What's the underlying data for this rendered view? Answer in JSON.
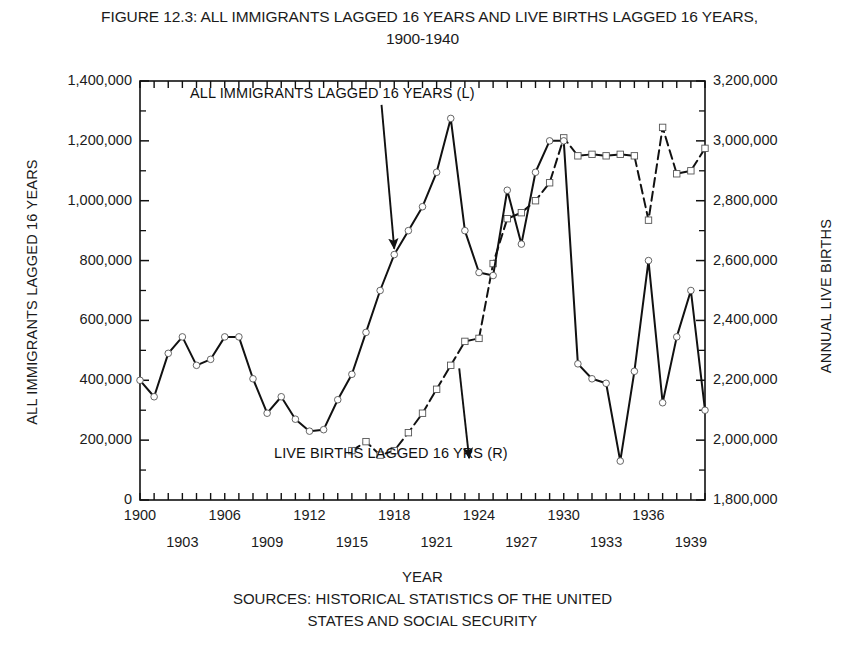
{
  "figure": {
    "title_line1": "FIGURE 12.3: ALL IMMIGRANTS LAGGED 16 YEARS AND LIVE BIRTHS LAGGED 16 YEARS,",
    "title_line2": "1900-1940",
    "footer_line1": "YEAR",
    "footer_line2": "SOURCES: HISTORICAL STATISTICS OF THE UNITED",
    "footer_line3": "STATES AND SOCIAL SECURITY"
  },
  "chart_data": {
    "type": "line",
    "title": "FIGURE 12.3: ALL IMMIGRANTS LAGGED 16 YEARS AND LIVE BIRTHS LAGGED 16 YEARS, 1900-1940",
    "xlabel": "YEAR",
    "ylabel": "ALL IMMIGRANTS LAGGED 16 YEARS",
    "ylabel_right": "ANNUAL LIVE BIRTHS",
    "grid": false,
    "legend_position": "inline-annotations",
    "xlim": [
      1900,
      1940
    ],
    "ylim": [
      0,
      1400000
    ],
    "ylim_right": [
      1800000,
      3200000
    ],
    "ytick_labels_left": [
      "0",
      "200,000",
      "400,000",
      "600,000",
      "800,000",
      "1,000,000",
      "1,200,000",
      "1,400,000"
    ],
    "ytick_values_left": [
      0,
      200000,
      400000,
      600000,
      800000,
      1000000,
      1200000,
      1400000
    ],
    "ytick_labels_right": [
      "1,800,000",
      "2,000,000",
      "2,200,000",
      "2,400,000",
      "2,600,000",
      "2,800,000",
      "3,000,000",
      "3,200,000"
    ],
    "ytick_values_right": [
      1800000,
      2000000,
      2200000,
      2400000,
      2600000,
      2800000,
      3000000,
      3200000
    ],
    "xtick_labels_row1": [
      "1900",
      "1906",
      "1912",
      "1918",
      "1924",
      "1930",
      "1936"
    ],
    "xtick_values_row1": [
      1900,
      1906,
      1912,
      1918,
      1924,
      1930,
      1936
    ],
    "xtick_labels_row2": [
      "1903",
      "1909",
      "1915",
      "1921",
      "1927",
      "1933",
      "1939"
    ],
    "xtick_values_row2": [
      1903,
      1909,
      1915,
      1921,
      1927,
      1933,
      1939
    ],
    "x": [
      1900,
      1901,
      1902,
      1903,
      1904,
      1905,
      1906,
      1907,
      1908,
      1909,
      1910,
      1911,
      1912,
      1913,
      1914,
      1915,
      1916,
      1917,
      1918,
      1919,
      1920,
      1921,
      1922,
      1923,
      1924,
      1925,
      1926,
      1927,
      1928,
      1929,
      1930,
      1931,
      1932,
      1933,
      1934,
      1935,
      1936,
      1937,
      1938,
      1939,
      1940
    ],
    "series": [
      {
        "name": "ALL IMMIGRANTS LAGGED 16 YEARS (L)",
        "axis": "left",
        "style": "solid",
        "marker": "circle",
        "values": [
          400000,
          345000,
          490000,
          545000,
          450000,
          470000,
          545000,
          545000,
          405000,
          290000,
          345000,
          270000,
          230000,
          235000,
          335000,
          420000,
          560000,
          700000,
          820000,
          900000,
          980000,
          1095000,
          1275000,
          900000,
          760000,
          750000,
          1035000,
          855000,
          1095000,
          1200000,
          1200000,
          455000,
          405000,
          390000,
          130000,
          430000,
          800000,
          325000,
          545000,
          700000,
          300000
        ]
      },
      {
        "name": "LIVE BIRTHS LAGGED 16 YRS (R)",
        "axis": "right",
        "style": "dashed",
        "marker": "square",
        "values": [
          null,
          null,
          null,
          null,
          null,
          null,
          null,
          null,
          null,
          null,
          null,
          null,
          null,
          null,
          null,
          1965000,
          1995000,
          1950000,
          1965000,
          2025000,
          2090000,
          2170000,
          2250000,
          2330000,
          2340000,
          2590000,
          2740000,
          2760000,
          2800000,
          2860000,
          3010000,
          2950000,
          2955000,
          2950000,
          2955000,
          2950000,
          2735000,
          3045000,
          2890000,
          2900000,
          2975000
        ]
      }
    ],
    "annotations": [
      {
        "text": "ALL IMMIGRANTS LAGGED 16 YEARS (L)",
        "arrow_from": [
          1917.1,
          1320000
        ],
        "arrow_to": [
          1918.0,
          840000
        ]
      },
      {
        "text": "LIVE BIRTHS LAGGED 16 YRS (R)",
        "arrow_from": [
          1922.6,
          440000
        ],
        "arrow_to": [
          1923.3,
          140000
        ]
      }
    ]
  }
}
